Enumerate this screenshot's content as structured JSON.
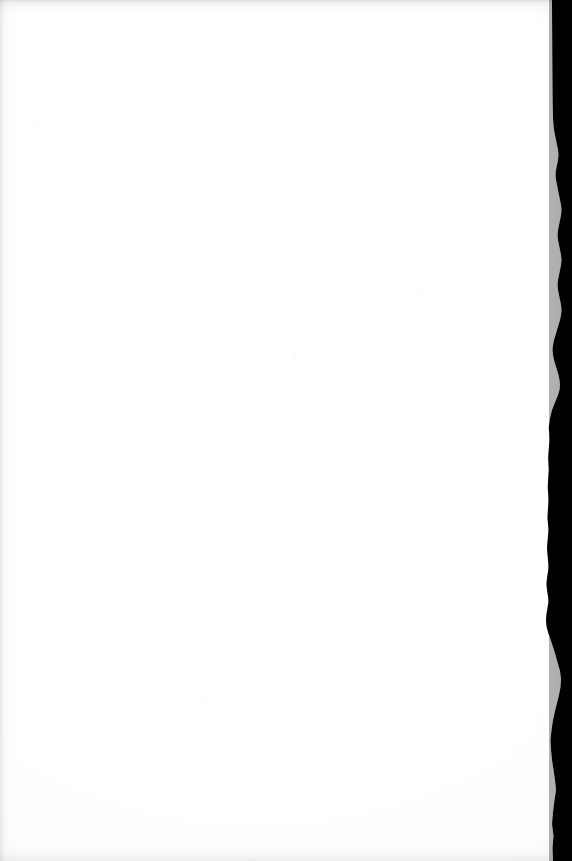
{
  "page": {
    "kind": "blank-scanned-page",
    "width": 572,
    "height": 861,
    "paper_color": "#ffffff",
    "text_content": "",
    "visible_text": []
  },
  "scan_edge": {
    "name": "right-scan-edge",
    "color": "#000000",
    "side": "right",
    "approx_left_x": 546,
    "approx_right_x": 572,
    "profile_note": "Irregular jagged page-edge shadow varying between x=546 and x=566"
  },
  "edge_shading": {
    "top_color": "#9a9aa0",
    "left_color": "#a0a0a6",
    "bottom_color": "#aaaab0"
  },
  "artifacts": {
    "dust_specks": [
      {
        "x": 31,
        "y": 124,
        "size": 3
      },
      {
        "x": 159,
        "y": 36,
        "size": 2
      },
      {
        "x": 293,
        "y": 355,
        "size": 3
      },
      {
        "x": 153,
        "y": 234,
        "size": 2
      },
      {
        "x": 420,
        "y": 288,
        "size": 2
      },
      {
        "x": 137,
        "y": 518,
        "size": 2
      },
      {
        "x": 270,
        "y": 393,
        "size": 2
      },
      {
        "x": 479,
        "y": 560,
        "size": 2
      },
      {
        "x": 200,
        "y": 700,
        "size": 2
      },
      {
        "x": 355,
        "y": 625,
        "size": 2
      }
    ]
  }
}
